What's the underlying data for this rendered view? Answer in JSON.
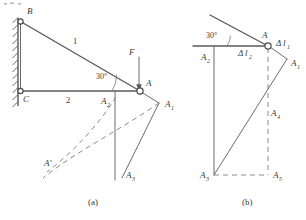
{
  "figure": {
    "caption_a": "(a)",
    "caption_b": "(b)",
    "diagram_a": {
      "name": "truss-free-body-diagram",
      "joint_labels": {
        "B": "B",
        "C": "C",
        "A": "A",
        "A_prime": "A'",
        "A1": "A",
        "A1_sub": "1",
        "A2": "A",
        "A2_sub": "2",
        "A3": "A",
        "A3_sub": "3"
      },
      "member_labels": {
        "member_1": "1",
        "member_2": "2"
      },
      "force_label": "F",
      "angle_label": "30°"
    },
    "diagram_b": {
      "name": "displacement-diagram",
      "angle_label": "30°",
      "joint_labels": {
        "A": "A",
        "A1": "A",
        "A1_sub": "1",
        "A2": "A",
        "A2_sub": "2",
        "A3": "A",
        "A3_sub": "3",
        "A4": "A",
        "A4_sub": "4",
        "A5": "A",
        "A5_sub": "5"
      },
      "elongation_labels": {
        "dl1_delta": "Δ",
        "dl1_l": "l",
        "dl1_sub": "1",
        "dl2_delta": "Δ",
        "dl2_l": "l",
        "dl2_sub": "2"
      }
    }
  },
  "colors": {
    "ink": "#3a3a3a",
    "member": "#5a5a5a",
    "dashed": "#8a8a8a",
    "background": "#ffffff"
  }
}
